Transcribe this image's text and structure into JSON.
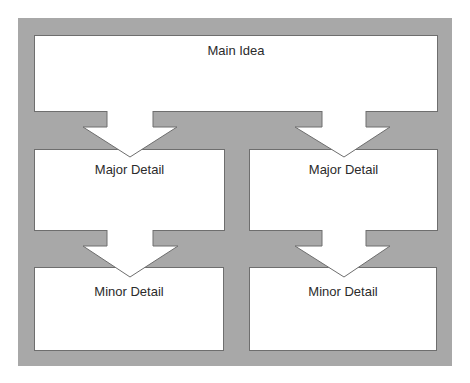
{
  "diagram": {
    "main": {
      "label": "Main Idea"
    },
    "major": [
      {
        "label": "Major Detail"
      },
      {
        "label": "Major Detail"
      }
    ],
    "minor": [
      {
        "label": "Minor Detail"
      },
      {
        "label": "Minor Detail"
      }
    ],
    "colors": {
      "background_panel": "#a8a8a8",
      "box_fill": "#ffffff",
      "box_border": "#6e6e6e",
      "text": "#2b2b2b"
    }
  }
}
